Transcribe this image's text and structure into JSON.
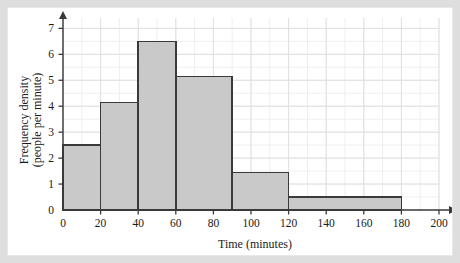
{
  "figure": {
    "background_color": "#dedede",
    "paper_color": "#ffffff",
    "bar_fill": "#c9c9c9",
    "bar_stroke": "#3a3a3a",
    "axis_color": "#3a3a3a",
    "grid_major_color": "#e0e0e0",
    "grid_minor_color": "#efefef"
  },
  "chart_data": {
    "type": "bar",
    "title": "",
    "subtitle": "",
    "xlabel": "Time (minutes)",
    "ylabel": "Frequency density (people per minute)",
    "ylabel_line1": "Frequency density",
    "ylabel_line2": "(people per minute)",
    "xlim": [
      0,
      200
    ],
    "ylim": [
      0,
      7.4
    ],
    "xticks": [
      0,
      20,
      40,
      60,
      80,
      100,
      120,
      140,
      160,
      180,
      200
    ],
    "xtick_labels": [
      "0",
      "20",
      "40",
      "60",
      "80",
      "100",
      "120",
      "140",
      "160",
      "180",
      "200"
    ],
    "yticks": [
      0,
      1,
      2,
      3,
      4,
      5,
      6,
      7
    ],
    "ytick_labels": [
      "0",
      "1",
      "2",
      "3",
      "4",
      "5",
      "6",
      "7"
    ],
    "grid": true,
    "grid_x_minor_step": 10,
    "grid_y_minor_step": 0.5,
    "legend": false,
    "legend_position": "none",
    "bins": [
      {
        "label": "0-20",
        "x_start": 0,
        "x_end": 20,
        "frequency_density": 2.5,
        "frequency": 50
      },
      {
        "label": "20-40",
        "x_start": 20,
        "x_end": 40,
        "frequency_density": 4.15,
        "frequency": 83
      },
      {
        "label": "40-60",
        "x_start": 40,
        "x_end": 60,
        "frequency_density": 6.5,
        "frequency": 130
      },
      {
        "label": "60-90",
        "x_start": 60,
        "x_end": 90,
        "frequency_density": 5.15,
        "frequency": 154.5
      },
      {
        "label": "90-120",
        "x_start": 90,
        "x_end": 120,
        "frequency_density": 1.45,
        "frequency": 43.5
      },
      {
        "label": "120-180",
        "x_start": 120,
        "x_end": 180,
        "frequency_density": 0.5,
        "frequency": 30
      }
    ],
    "categories": [
      "0-20",
      "20-40",
      "40-60",
      "60-90",
      "90-120",
      "120-180"
    ],
    "values": [
      2.5,
      4.15,
      6.5,
      5.15,
      1.45,
      0.5
    ]
  }
}
